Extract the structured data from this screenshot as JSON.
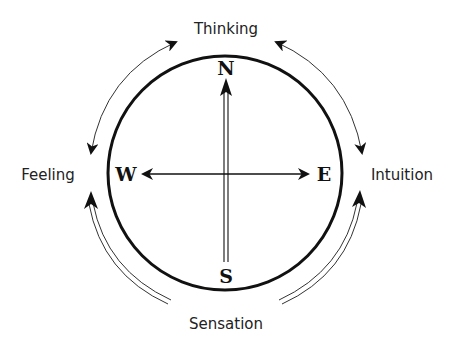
{
  "diagram": {
    "type": "compass-of-psychological-functions",
    "functions": {
      "top": "Thinking",
      "left": "Feeling",
      "right": "Intuition",
      "bottom": "Sensation"
    },
    "directions": {
      "north": "N",
      "west": "W",
      "east": "E",
      "south": "S"
    },
    "relations": [
      {
        "from": "Thinking",
        "to": "Feeling",
        "style": "single-line",
        "heads": "both"
      },
      {
        "from": "Thinking",
        "to": "Intuition",
        "style": "single-line",
        "heads": "both"
      },
      {
        "from": "Sensation",
        "to": "Feeling",
        "style": "double-line",
        "heads": "end"
      },
      {
        "from": "Sensation",
        "to": "Intuition",
        "style": "double-line",
        "heads": "end"
      }
    ],
    "axes": [
      {
        "orientation": "horizontal",
        "from": "W",
        "to": "E",
        "style": "single-line",
        "heads": "both"
      },
      {
        "orientation": "vertical",
        "from": "S",
        "to": "N",
        "style": "double-line",
        "heads": "end"
      }
    ],
    "colors": {
      "stroke": "#111111",
      "background": "#ffffff"
    }
  }
}
